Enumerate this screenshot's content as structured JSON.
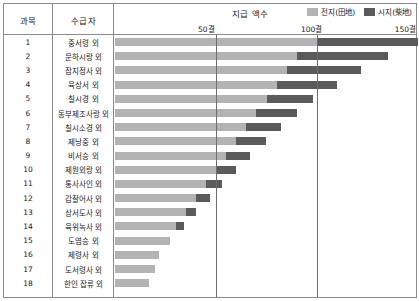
{
  "table": {
    "columns": {
      "index": "과목",
      "recipient": "수급자"
    },
    "chart_header_title": "지급 액수"
  },
  "legend": {
    "items": [
      {
        "label": "전지(田地)",
        "color": "#b3b3b3",
        "icon": "legend-swatch-icon"
      },
      {
        "label": "시지(柴地)",
        "color": "#5a5a5a",
        "icon": "legend-swatch-icon"
      }
    ]
  },
  "axis": {
    "unit": "결",
    "ticks": [
      {
        "label": "50결",
        "value": 50
      },
      {
        "label": "100결",
        "value": 100
      },
      {
        "label": "150결",
        "value": 150
      }
    ],
    "max": 150,
    "min": 0
  },
  "chart_data": {
    "type": "bar",
    "orientation": "horizontal",
    "stacked": true,
    "title": "지급 액수",
    "xlabel": "결",
    "ylabel": "수급자",
    "xlim": [
      0,
      150
    ],
    "grid": true,
    "legend_position": "top-right",
    "categories": [
      "중서령 외",
      "문하시랑 외",
      "참지정사 외",
      "육상서 외",
      "칠시경 외",
      "동부제조사랑 외",
      "칠시소경 외",
      "제낭중 외",
      "비서승 외",
      "제원외랑 외",
      "통사사인 외",
      "감찰어사 외",
      "상서도사 외",
      "육위녹사 외",
      "도염승 외",
      "제령사 외",
      "도서령사 외",
      "한인 잡류 외"
    ],
    "row_numbers": [
      1,
      2,
      3,
      4,
      5,
      6,
      7,
      8,
      9,
      10,
      11,
      12,
      13,
      14,
      15,
      16,
      17,
      18
    ],
    "series": [
      {
        "name": "전지(田地)",
        "color": "#b3b3b3",
        "values": [
          100,
          90,
          85,
          80,
          75,
          70,
          65,
          60,
          55,
          50,
          45,
          40,
          35,
          30,
          27,
          22,
          20,
          17
        ]
      },
      {
        "name": "시지(柴地)",
        "color": "#5a5a5a",
        "values": [
          50,
          45,
          37,
          30,
          23,
          20,
          17,
          15,
          12,
          10,
          8,
          7,
          5,
          4,
          0,
          0,
          0,
          0
        ]
      }
    ],
    "totals": [
      150,
      135,
      122,
      110,
      98,
      90,
      82,
      75,
      67,
      60,
      53,
      47,
      40,
      34,
      27,
      22,
      20,
      17
    ]
  }
}
